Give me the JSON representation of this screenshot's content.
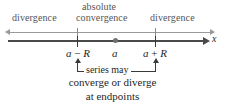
{
  "figure": {
    "type": "number-line-diagram",
    "topic": "radius of convergence of a power series",
    "axis_variable": "x",
    "colors": {
      "axis": "#4a4a4a",
      "guide_line": "#9a9a9a",
      "text": "#1f1f1f",
      "top_label_text": "#555555",
      "point_marker": "#6f6f6f",
      "background": "#ffffff"
    }
  },
  "regions": {
    "left": {
      "label": "divergence"
    },
    "center": {
      "label_line1": "absolute",
      "label_line2": "convergence"
    },
    "right": {
      "label": "divergence"
    }
  },
  "axis": {
    "variable_label": "x",
    "ticks": [
      {
        "name": "left-endpoint",
        "label": "a − R",
        "label_parts": {
          "a": "a",
          "op": "−",
          "R": "R"
        }
      },
      {
        "name": "center",
        "label": "a",
        "label_parts": {
          "a": "a"
        }
      },
      {
        "name": "right-endpoint",
        "label": "a + R",
        "label_parts": {
          "a": "a",
          "op": "+",
          "R": "R"
        }
      }
    ]
  },
  "annotation": {
    "bracket_caption": "series may",
    "caption_line2": "converge or diverge",
    "caption_line3": "at endpoints"
  },
  "chart_data": {
    "type": "line",
    "title": "",
    "xlabel": "x",
    "ylabel": "",
    "grid": false,
    "legend": "none",
    "x_tick_labels": [
      "a − R",
      "a",
      "a + R"
    ],
    "x_tick_positions": [
      77,
      116,
      155
    ],
    "annotations": [
      {
        "text": "divergence",
        "region": "x < a − R"
      },
      {
        "text": "absolute convergence",
        "region": "a − R < x < a + R"
      },
      {
        "text": "divergence",
        "region": "x > a + R"
      },
      {
        "text": "series may converge or diverge at endpoints",
        "region": "x = a − R and x = a + R"
      }
    ]
  }
}
